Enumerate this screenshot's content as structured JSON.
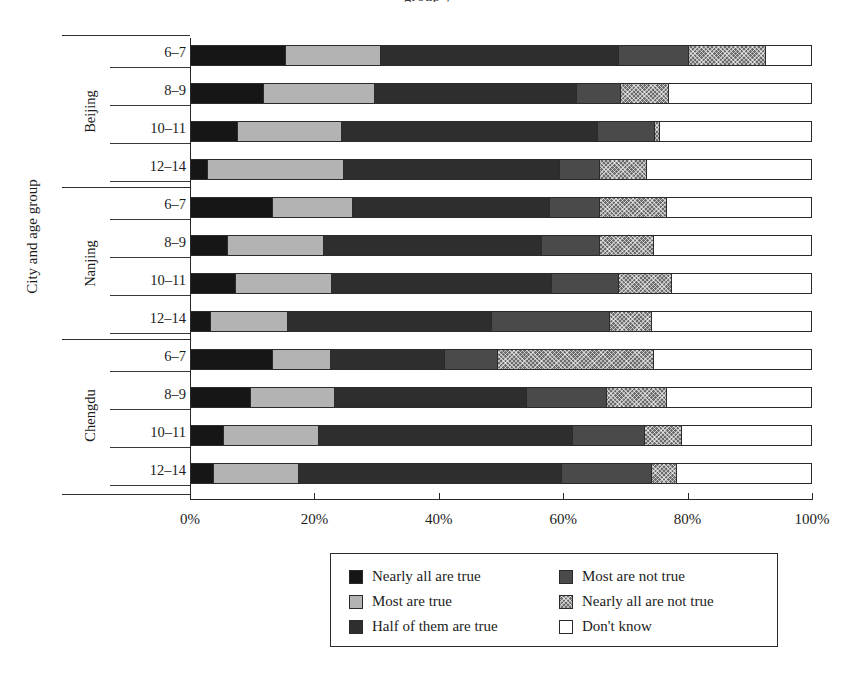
{
  "figure": {
    "cropped_top_text": "group  y",
    "y_axis_title": "City and age group"
  },
  "legend": {
    "left_column": [
      {
        "label": "Nearly all are true",
        "key": "nearly-all-true",
        "color": "#161616"
      },
      {
        "label": "Most are true",
        "key": "most-true",
        "color": "#b3b3b3"
      },
      {
        "label": "Half of them are true",
        "key": "half-true",
        "color": "#2e2e2e"
      }
    ],
    "right_column": [
      {
        "label": "Most are not true",
        "key": "most-not-true",
        "color": "#4a4a4a"
      },
      {
        "label": "Nearly all are not true",
        "key": "nearly-all-not-true",
        "color": "#6b6b6b"
      },
      {
        "label": "Don't know",
        "key": "dont-know",
        "color": "#ffffff"
      }
    ]
  },
  "chart_data": {
    "type": "bar",
    "orientation": "horizontal",
    "stacked": true,
    "normalized": true,
    "title": "",
    "xlabel": "",
    "ylabel": "City and age group",
    "xlim": [
      0,
      100
    ],
    "xticks": [
      "0%",
      "20%",
      "40%",
      "60%",
      "80%",
      "100%"
    ],
    "xtick_values": [
      0,
      20,
      40,
      60,
      80,
      100
    ],
    "grid": false,
    "legend_position": "bottom",
    "series": [
      {
        "name": "Nearly all are true",
        "values": [
          15.3,
          11.7,
          7.5,
          2.7,
          13.2,
          6.0,
          7.2,
          3.2,
          13.3,
          9.6,
          5.3,
          3.7
        ]
      },
      {
        "name": "Most are true",
        "values": [
          27.0,
          29.7,
          24.4,
          31.0,
          26.2,
          21.9,
          22.7,
          15.6,
          22.5,
          22.5,
          21.0,
          17.2
        ]
      },
      {
        "name": "Half of them are true",
        "values": [
          26.5,
          46.1,
          45.7,
          47.0,
          40.8,
          47.7,
          44.1,
          48.2,
          19.0,
          40.9,
          56.6,
          70.5
        ]
      },
      {
        "name": "Most are not true",
        "values": [
          17.9,
          7.2,
          9.1,
          6.4,
          8.0,
          9.3,
          10.8,
          19.0,
          8.5,
          12.9,
          11.6,
          14.6
        ]
      },
      {
        "name": "Nearly all are not true",
        "values": [
          6.4,
          23.3,
          0.8,
          7.6,
          10.9,
          8.8,
          8.4,
          6.8,
          25.2,
          9.6,
          6.0,
          4.0
        ]
      },
      {
        "name": "Don't know",
        "values": [
          6.9,
          -0.9,
          12.5,
          5.3,
          0.9,
          6.3,
          6.8,
          7.2,
          11.5,
          4.5,
          -0.5,
          -0.0
        ]
      }
    ],
    "groups": [
      {
        "city": "Beijing",
        "rows": [
          {
            "age": "6–7",
            "values": [
              15.3,
              15.3,
              38.4,
              11.3,
              12.5,
              7.2
            ]
          },
          {
            "age": "8–9",
            "values": [
              11.7,
              18.0,
              32.5,
              7.2,
              7.7,
              22.9
            ]
          },
          {
            "age": "10–11",
            "values": [
              7.5,
              16.9,
              41.3,
              9.1,
              0.8,
              24.4
            ]
          },
          {
            "age": "12–14",
            "values": [
              2.7,
              21.9,
              34.9,
              6.4,
              7.6,
              26.5
            ]
          }
        ]
      },
      {
        "city": "Nanjing",
        "rows": [
          {
            "age": "6–7",
            "values": [
              13.2,
              13.0,
              31.7,
              8.0,
              10.9,
              23.2
            ]
          },
          {
            "age": "8–9",
            "values": [
              6.0,
              15.4,
              35.2,
              9.3,
              8.8,
              25.3
            ]
          },
          {
            "age": "10–11",
            "values": [
              7.2,
              15.6,
              35.5,
              10.8,
              8.4,
              22.5
            ]
          },
          {
            "age": "12–14",
            "values": [
              3.2,
              12.4,
              33.0,
              19.0,
              6.8,
              25.6
            ]
          }
        ]
      },
      {
        "city": "Chengdu",
        "rows": [
          {
            "age": "6–7",
            "values": [
              13.3,
              9.2,
              18.5,
              8.5,
              25.2,
              25.3
            ]
          },
          {
            "age": "8–9",
            "values": [
              9.6,
              13.7,
              30.9,
              12.9,
              9.6,
              23.3
            ]
          },
          {
            "age": "10–11",
            "values": [
              5.3,
              15.3,
              41.0,
              11.6,
              6.0,
              20.8
            ]
          },
          {
            "age": "12–14",
            "values": [
              3.7,
              13.7,
              42.4,
              14.6,
              4.0,
              21.6
            ]
          }
        ]
      }
    ]
  }
}
